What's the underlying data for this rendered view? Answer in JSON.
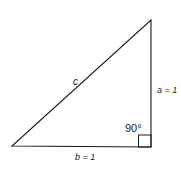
{
  "diagram": {
    "type": "right-triangle",
    "vertices": {
      "top": [
        151,
        20
      ],
      "right_angle": [
        151,
        147
      ],
      "left": [
        12,
        146
      ]
    },
    "labels": {
      "hypotenuse": "c",
      "vertical_side": "a = 1",
      "horizontal_side": "b = 1",
      "angle": "90°"
    },
    "stroke_color": "#1a1a1a"
  }
}
